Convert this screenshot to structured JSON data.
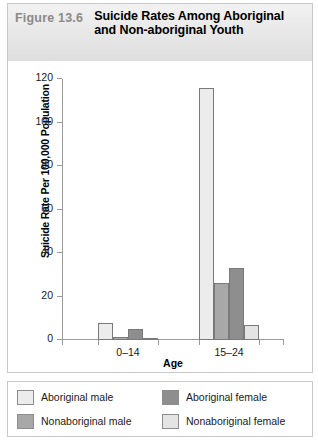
{
  "header": {
    "figure_number": "Figure 13.6",
    "title": "Suicide Rates Among Aboriginal and Non-aboriginal Youth"
  },
  "chart_data": {
    "type": "bar",
    "title": "Suicide Rates Among Aboriginal and Non-aboriginal Youth",
    "xlabel": "Age",
    "ylabel": "Suicide Rate Per 100,000 Population",
    "categories": [
      "0–14",
      "15–24"
    ],
    "ylim": [
      0,
      120
    ],
    "yticks": [
      0,
      20,
      40,
      60,
      80,
      100,
      120
    ],
    "grid": false,
    "legend_position": "bottom",
    "series": [
      {
        "name": "Aboriginal male",
        "color": "#ececec",
        "values": [
          8,
          116
        ]
      },
      {
        "name": "Nonaboriginal male",
        "color": "#a8a8a8",
        "values": [
          1.5,
          26
        ]
      },
      {
        "name": "Aboriginal  female",
        "color": "#8e8e8e",
        "values": [
          5,
          33
        ]
      },
      {
        "name": "Nonaboriginal female",
        "color": "#e4e4e4",
        "values": [
          0.5,
          7
        ]
      }
    ]
  }
}
